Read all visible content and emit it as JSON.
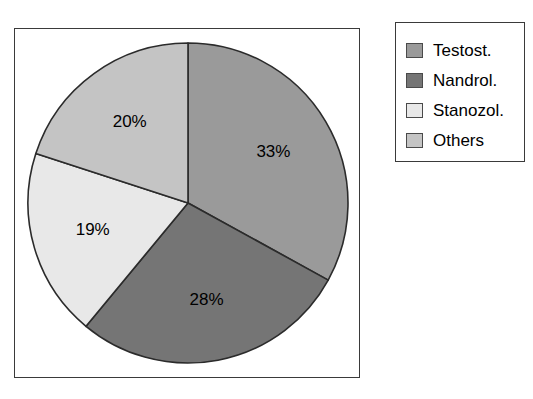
{
  "chart_data": {
    "type": "pie",
    "title": "",
    "subtitle": "",
    "xlabel": "",
    "ylabel": "",
    "grid": false,
    "legend_position": "right",
    "start_angle_deg": 0,
    "direction": "clockwise",
    "categories": [
      "Testost.",
      "Nandrol.",
      "Stanozol.",
      "Others"
    ],
    "values": [
      33,
      28,
      19,
      20
    ],
    "value_unit": "%",
    "data_labels": [
      "33%",
      "28%",
      "19%",
      "20%"
    ],
    "colors": [
      "#9a9a9a",
      "#757575",
      "#e8e8e8",
      "#c4c4c4"
    ],
    "slices": [
      {
        "label": "Testost.",
        "value": 33,
        "data_label": "33%",
        "color": "#9a9a9a"
      },
      {
        "label": "Nandrol.",
        "value": 28,
        "data_label": "28%",
        "color": "#757575"
      },
      {
        "label": "Stanozol.",
        "value": 19,
        "data_label": "19%",
        "color": "#e8e8e8"
      },
      {
        "label": "Others",
        "value": 20,
        "data_label": "20%",
        "color": "#c4c4c4"
      }
    ]
  },
  "legend": {
    "items": [
      {
        "label": "Testost.",
        "color": "#9a9a9a"
      },
      {
        "label": "Nandrol.",
        "color": "#757575"
      },
      {
        "label": "Stanozol.",
        "color": "#e8e8e8"
      },
      {
        "label": "Others",
        "color": "#c4c4c4"
      }
    ]
  },
  "style": {
    "frame_color": "#3a3a3a",
    "slice_outline": "#2b2b2b",
    "background": "#ffffff",
    "text_color": "#000000"
  }
}
